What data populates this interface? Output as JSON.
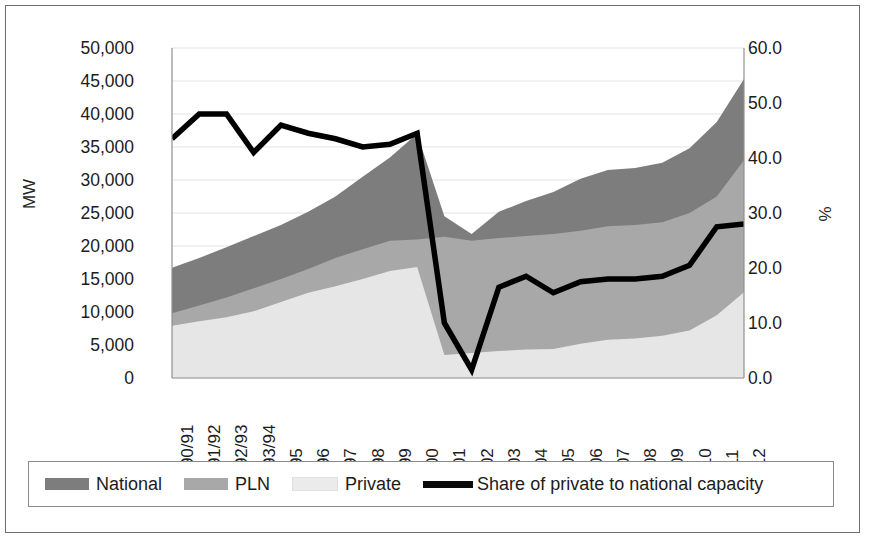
{
  "chart_data": {
    "type": "area",
    "title": "",
    "subtitle": "",
    "xlabel": "",
    "ylabel": "MW",
    "ylabel_secondary": "%",
    "grid": true,
    "legend_position": "bottom",
    "ylim": [
      0,
      50000
    ],
    "ylim_secondary": [
      0.0,
      60.0
    ],
    "yticks": [
      "0",
      "5,000",
      "10,000",
      "15,000",
      "20,000",
      "25,000",
      "30,000",
      "35,000",
      "40,000",
      "45,000",
      "50,000"
    ],
    "yticks_secondary": [
      "0.0",
      "10.0",
      "20.0",
      "30.0",
      "40.0",
      "50.0",
      "60.0"
    ],
    "categories": [
      "1990/91",
      "1991/92",
      "1992/93",
      "1993/94",
      "1995",
      "1996",
      "1997",
      "1998",
      "1999",
      "2000",
      "2001",
      "2002",
      "2003",
      "2004",
      "2005",
      "2006",
      "2007",
      "2008",
      "2009",
      "2010",
      "2011",
      "2012"
    ],
    "series": [
      {
        "name": "National",
        "axis": "left",
        "type": "area",
        "color": "#7d7d7d",
        "values": [
          16700,
          18200,
          19800,
          21500,
          23200,
          25200,
          27500,
          30500,
          33400,
          37000,
          24500,
          21800,
          25200,
          26800,
          28200,
          30200,
          31500,
          31800,
          32600,
          34800,
          38800,
          45300
        ]
      },
      {
        "name": "PLN",
        "axis": "left",
        "type": "area",
        "color": "#a8a8a8",
        "values": [
          9800,
          11000,
          12200,
          13600,
          15000,
          16500,
          18200,
          19500,
          20800,
          21000,
          21400,
          20800,
          21200,
          21500,
          21800,
          22300,
          23000,
          23200,
          23600,
          25000,
          27500,
          33000
        ]
      },
      {
        "name": "Private",
        "axis": "left",
        "type": "area",
        "color": "#e6e6e6",
        "values": [
          7900,
          8600,
          9200,
          10100,
          11500,
          12900,
          13900,
          15000,
          16200,
          16800,
          3500,
          3800,
          4100,
          4300,
          4400,
          5200,
          5800,
          6000,
          6400,
          7200,
          9500,
          13000
        ]
      },
      {
        "name": "Share of private to national capacity",
        "axis": "right",
        "type": "line",
        "color": "#000000",
        "values": [
          43.5,
          48.0,
          48.0,
          41.0,
          46.0,
          44.5,
          43.5,
          42.0,
          42.5,
          44.5,
          10.0,
          1.5,
          16.5,
          18.5,
          15.5,
          17.5,
          18.0,
          18.0,
          18.5,
          20.5,
          27.5,
          28.0
        ]
      }
    ]
  },
  "legend": {
    "items": [
      {
        "label": "National",
        "type": "swatch",
        "color": "#7d7d7d"
      },
      {
        "label": "PLN",
        "type": "swatch",
        "color": "#a8a8a8"
      },
      {
        "label": "Private",
        "type": "swatch",
        "color": "#ebebeb"
      },
      {
        "label": "Share of private to national capacity",
        "type": "line",
        "color": "#0a0a0a"
      }
    ]
  }
}
